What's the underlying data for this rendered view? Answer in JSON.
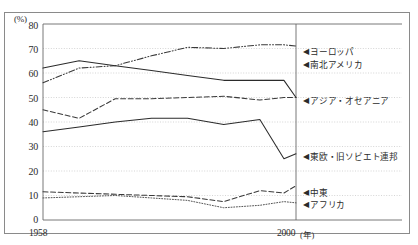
{
  "figure": {
    "unit_label": "(%)",
    "x_axis_caption": "(年)"
  },
  "axes": {
    "y_ticks": [
      "80",
      "70",
      "60",
      "50",
      "40",
      "30",
      "20",
      "10",
      "0"
    ],
    "y_values": [
      80,
      70,
      60,
      50,
      40,
      30,
      20,
      10,
      0
    ],
    "x_ticks": [
      "1958",
      "2000"
    ],
    "x_values": [
      1958,
      2000
    ]
  },
  "labels": {
    "europe": "ヨーロッパ",
    "americas": "南北アメリカ",
    "asia_oceania": "アジア・オセアニア",
    "eeurope_ussr": "東欧・旧ソビエト連邦",
    "middle_east": "中東",
    "africa": "アフリカ",
    "marker": "◀"
  },
  "chart_data": {
    "type": "line",
    "title": "",
    "xlabel": "(年)",
    "ylabel": "(%)",
    "xlim": [
      1958,
      2000
    ],
    "ylim": [
      0,
      80
    ],
    "grid": true,
    "legend_position": "right-inline-arrows",
    "x": [
      1958,
      1964,
      1970,
      1976,
      1982,
      1988,
      1994,
      1998,
      2000
    ],
    "series": [
      {
        "name": "ヨーロッパ",
        "style": "dash-dot-dot",
        "color": "#3a3a3a",
        "values": [
          56,
          62,
          63,
          67,
          70.5,
          70,
          71.5,
          71.5,
          71
        ]
      },
      {
        "name": "南北アメリカ",
        "style": "solid",
        "color": "#2b2b2b",
        "values": [
          62,
          65,
          63,
          61,
          59,
          57,
          57,
          57,
          50
        ]
      },
      {
        "name": "アジア・オセアニア",
        "style": "dashed",
        "color": "#3a3a3a",
        "values": [
          45,
          41.5,
          49.5,
          49.5,
          50,
          50.5,
          49,
          50,
          50
        ]
      },
      {
        "name": "東欧・旧ソビエト連邦",
        "style": "solid-steep",
        "color": "#2b2b2b",
        "values": [
          36,
          38,
          40,
          41.5,
          41.5,
          39,
          41,
          25,
          27
        ]
      },
      {
        "name": "中東",
        "style": "dashed",
        "color": "#3a3a3a",
        "values": [
          11.5,
          11,
          10.5,
          10,
          9.5,
          7.5,
          12,
          11,
          14
        ]
      },
      {
        "name": "アフリカ",
        "style": "dotted",
        "color": "#555555",
        "values": [
          9,
          9.5,
          10,
          9,
          8,
          5,
          6,
          7.5,
          7
        ]
      }
    ]
  }
}
